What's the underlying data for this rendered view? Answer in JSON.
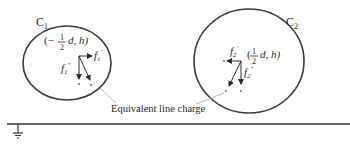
{
  "diagram": {
    "conductor1": {
      "label": "C",
      "label_sub": "1",
      "coord_prefix": "(−",
      "coord_frac_num": "1",
      "coord_frac_den": "2",
      "coord_suffix": "d, h)",
      "force_horizontal": "f",
      "force_horizontal_sub": "1",
      "force_horizontal_sup": "′",
      "force_vertical": "f",
      "force_vertical_sub": "1",
      "force_vertical_sup": "″"
    },
    "conductor2": {
      "label": "C",
      "label_sub": "2",
      "coord_prefix": "(",
      "coord_frac_num": "1",
      "coord_frac_den": "2",
      "coord_suffix": "d, h)",
      "force_horizontal": "f",
      "force_horizontal_sub": "2",
      "force_horizontal_sup": "′",
      "force_vertical": "f",
      "force_vertical_sub": "2",
      "force_vertical_sup": "″"
    },
    "annotation": "Equivalent line charge",
    "ground_symbol": "ground-icon",
    "colors": {
      "stroke": "#3a3a3a",
      "leader": "#b0b0b0",
      "text": "#2a2a2a"
    }
  }
}
